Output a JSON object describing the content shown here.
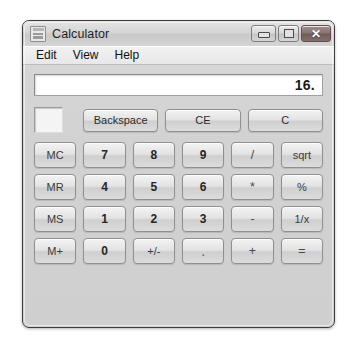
{
  "window": {
    "title": "Calculator",
    "icon": "calculator-icon",
    "controls": {
      "minimize_label": "",
      "maximize_label": "",
      "close_label": "✕"
    }
  },
  "menu": {
    "items": [
      {
        "label": "Edit"
      },
      {
        "label": "View"
      },
      {
        "label": "Help"
      }
    ]
  },
  "display": {
    "value": "16."
  },
  "memory": {
    "indicator_text": ""
  },
  "top_row": {
    "buttons": [
      {
        "label": "Backspace",
        "name": "backspace-button"
      },
      {
        "label": "CE",
        "name": "clear-entry-button"
      },
      {
        "label": "C",
        "name": "clear-button"
      }
    ]
  },
  "keypad": {
    "rows": [
      [
        {
          "label": "MC",
          "name": "memory-clear-button",
          "style": "key-mem"
        },
        {
          "label": "7",
          "name": "digit-7-button",
          "style": "key"
        },
        {
          "label": "8",
          "name": "digit-8-button",
          "style": "key"
        },
        {
          "label": "9",
          "name": "digit-9-button",
          "style": "key"
        },
        {
          "label": "/",
          "name": "divide-button",
          "style": "key-op"
        },
        {
          "label": "sqrt",
          "name": "sqrt-button",
          "style": "key-fn"
        }
      ],
      [
        {
          "label": "MR",
          "name": "memory-recall-button",
          "style": "key-mem"
        },
        {
          "label": "4",
          "name": "digit-4-button",
          "style": "key"
        },
        {
          "label": "5",
          "name": "digit-5-button",
          "style": "key"
        },
        {
          "label": "6",
          "name": "digit-6-button",
          "style": "key"
        },
        {
          "label": "*",
          "name": "multiply-button",
          "style": "key-op"
        },
        {
          "label": "%",
          "name": "percent-button",
          "style": "key-fn"
        }
      ],
      [
        {
          "label": "MS",
          "name": "memory-store-button",
          "style": "key-mem"
        },
        {
          "label": "1",
          "name": "digit-1-button",
          "style": "key"
        },
        {
          "label": "2",
          "name": "digit-2-button",
          "style": "key"
        },
        {
          "label": "3",
          "name": "digit-3-button",
          "style": "key"
        },
        {
          "label": "-",
          "name": "subtract-button",
          "style": "key-op"
        },
        {
          "label": "1/x",
          "name": "reciprocal-button",
          "style": "key-fn"
        }
      ],
      [
        {
          "label": "M+",
          "name": "memory-add-button",
          "style": "key-mem"
        },
        {
          "label": "0",
          "name": "digit-0-button",
          "style": "key"
        },
        {
          "label": "+/-",
          "name": "sign-toggle-button",
          "style": "key-fn"
        },
        {
          "label": ".",
          "name": "decimal-point-button",
          "style": "key-dot"
        },
        {
          "label": "+",
          "name": "add-button",
          "style": "key-op"
        },
        {
          "label": "=",
          "name": "equals-button",
          "style": "key-op"
        }
      ]
    ]
  },
  "colors": {
    "window_bg": "#d4d4d4",
    "titlebar": "#d8d8d8",
    "display_bg": "#ffffff",
    "button_face": "#e3e3e3",
    "close_button": "#8a7575",
    "text": "#1f1f1f"
  }
}
